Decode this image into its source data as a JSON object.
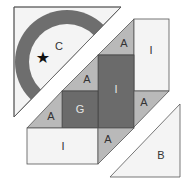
{
  "colors": {
    "background": "#ffffff",
    "light_fill": "#f4f4f4",
    "medium_fill": "#b9b9b9",
    "dark_fill": "#6b6b6b",
    "ring_fill": "#6e6e6e",
    "stroke": "#555555"
  },
  "pieces": {
    "corner_c": {
      "label": "C",
      "marker": "★"
    },
    "rect_i_top_right": {
      "label": "I"
    },
    "rect_i_center": {
      "label": "I"
    },
    "rect_i_bottom": {
      "label": "I"
    },
    "square_g": {
      "label": "G"
    },
    "tri_a_top": {
      "label": "A"
    },
    "tri_a_upper_left": {
      "label": "A"
    },
    "tri_a_left": {
      "label": "A"
    },
    "tri_a_right": {
      "label": "A"
    },
    "tri_a_bottom": {
      "label": "A"
    },
    "tri_b": {
      "label": "B"
    }
  }
}
